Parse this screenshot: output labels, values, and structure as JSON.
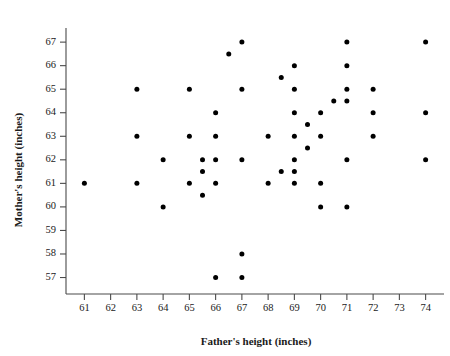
{
  "chart_data": {
    "type": "scatter",
    "title": "",
    "xlabel": "Father's height (inches)",
    "ylabel": "Mother's height (inches)",
    "xlim": [
      60.3,
      74.7
    ],
    "ylim": [
      56.3,
      67.6
    ],
    "xticks": [
      61,
      62,
      63,
      64,
      65,
      66,
      67,
      68,
      69,
      70,
      71,
      72,
      73,
      74
    ],
    "yticks": [
      57,
      58,
      59,
      60,
      61,
      62,
      63,
      64,
      65,
      66,
      67
    ],
    "xticklabels": [
      "61",
      "62",
      "63",
      "64",
      "65",
      "66",
      "67",
      "68",
      "69",
      "70",
      "71",
      "72",
      "73",
      "74"
    ],
    "yticklabels": [
      "57",
      "58",
      "59",
      "60",
      "61",
      "62",
      "63",
      "64",
      "65",
      "66",
      "67"
    ],
    "grid": false,
    "legend": null,
    "marker": {
      "shape": "circle",
      "color": "#000000",
      "size": 2.5
    },
    "points": [
      {
        "x": 61,
        "y": 61
      },
      {
        "x": 63,
        "y": 65
      },
      {
        "x": 63,
        "y": 63
      },
      {
        "x": 63,
        "y": 61
      },
      {
        "x": 64,
        "y": 62
      },
      {
        "x": 64,
        "y": 60
      },
      {
        "x": 65,
        "y": 65
      },
      {
        "x": 65,
        "y": 63
      },
      {
        "x": 65,
        "y": 61
      },
      {
        "x": 65.5,
        "y": 62
      },
      {
        "x": 65.5,
        "y": 61.5
      },
      {
        "x": 65.5,
        "y": 60.5
      },
      {
        "x": 66,
        "y": 64
      },
      {
        "x": 66,
        "y": 63
      },
      {
        "x": 66,
        "y": 62
      },
      {
        "x": 66,
        "y": 61
      },
      {
        "x": 66,
        "y": 57
      },
      {
        "x": 66.5,
        "y": 66.5
      },
      {
        "x": 67,
        "y": 67
      },
      {
        "x": 67,
        "y": 65
      },
      {
        "x": 67,
        "y": 62
      },
      {
        "x": 67,
        "y": 58
      },
      {
        "x": 67,
        "y": 57
      },
      {
        "x": 68,
        "y": 63
      },
      {
        "x": 68,
        "y": 61
      },
      {
        "x": 68.5,
        "y": 65.5
      },
      {
        "x": 68.5,
        "y": 61.5
      },
      {
        "x": 69,
        "y": 66
      },
      {
        "x": 69,
        "y": 65
      },
      {
        "x": 69,
        "y": 64
      },
      {
        "x": 69,
        "y": 63
      },
      {
        "x": 69,
        "y": 62
      },
      {
        "x": 69,
        "y": 61.5
      },
      {
        "x": 69,
        "y": 61
      },
      {
        "x": 69.5,
        "y": 63.5
      },
      {
        "x": 69.5,
        "y": 62.5
      },
      {
        "x": 70,
        "y": 64
      },
      {
        "x": 70,
        "y": 63
      },
      {
        "x": 70,
        "y": 61
      },
      {
        "x": 70,
        "y": 60
      },
      {
        "x": 70.5,
        "y": 64.5
      },
      {
        "x": 71,
        "y": 67
      },
      {
        "x": 71,
        "y": 66
      },
      {
        "x": 71,
        "y": 65
      },
      {
        "x": 71,
        "y": 64.5
      },
      {
        "x": 71,
        "y": 62
      },
      {
        "x": 71,
        "y": 60
      },
      {
        "x": 72,
        "y": 65
      },
      {
        "x": 72,
        "y": 64
      },
      {
        "x": 72,
        "y": 63
      },
      {
        "x": 74,
        "y": 67
      },
      {
        "x": 74,
        "y": 64
      },
      {
        "x": 74,
        "y": 62
      }
    ]
  }
}
